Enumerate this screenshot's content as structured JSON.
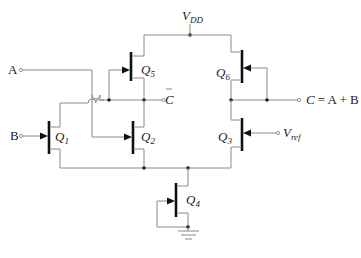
{
  "diagram": {
    "type": "circuit-schematic",
    "supply": {
      "label": "V",
      "sub": "DD"
    },
    "inputs": [
      {
        "id": "A",
        "label": "A"
      },
      {
        "id": "B",
        "label": "B"
      }
    ],
    "outputs": [
      {
        "id": "Cbar",
        "label": "C",
        "overline": true
      },
      {
        "id": "C",
        "label_var": "C",
        "label_expr": "= A + B"
      }
    ],
    "reference": {
      "label": "V",
      "sub": "ref"
    },
    "transistors": [
      {
        "id": "Q1",
        "label": "Q",
        "sub": "1"
      },
      {
        "id": "Q2",
        "label": "Q",
        "sub": "2"
      },
      {
        "id": "Q3",
        "label": "Q",
        "sub": "3"
      },
      {
        "id": "Q4",
        "label": "Q",
        "sub": "4"
      },
      {
        "id": "Q5",
        "label": "Q",
        "sub": "5"
      },
      {
        "id": "Q6",
        "label": "Q",
        "sub": "6"
      }
    ],
    "colors": {
      "wire": "#8a8a8a",
      "device": "#111111",
      "text": "#222222"
    }
  }
}
